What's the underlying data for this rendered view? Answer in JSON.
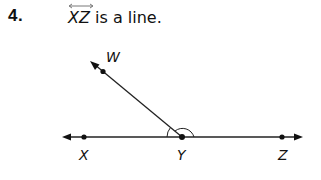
{
  "problem": {
    "number": "4.",
    "segment_name": "XZ",
    "statement_rest": " is a line."
  },
  "diagram": {
    "points": {
      "W": {
        "label": "W"
      },
      "X": {
        "label": "X"
      },
      "Y": {
        "label": "Y"
      },
      "Z": {
        "label": "Z"
      }
    },
    "line_color": "#222222"
  }
}
